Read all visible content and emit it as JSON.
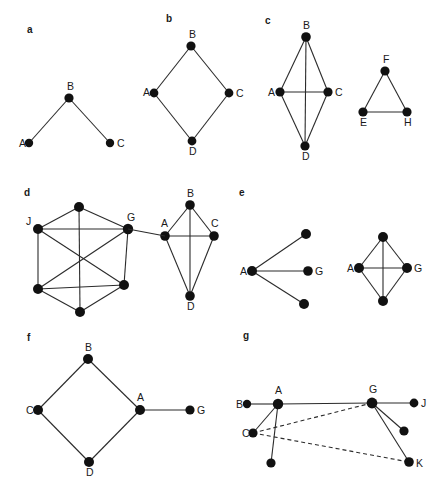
{
  "figure": {
    "width": 436,
    "height": 498,
    "background": "#ffffff",
    "edge_color": "#2b2b2b",
    "node_color": "#111111",
    "label_color": "#1a1a1a"
  },
  "panels": [
    {
      "id": "a",
      "letter": "a",
      "letter_pos": [
        27,
        33
      ],
      "graphs": [
        {
          "name": "path-graph",
          "nodes": [
            {
              "id": "A",
              "label": "A",
              "x": 29,
              "y": 143,
              "r": 4.2,
              "label_dx": -10,
              "label_dy": 4
            },
            {
              "id": "B",
              "label": "B",
              "x": 69,
              "y": 98,
              "r": 4.6,
              "label_dx": -2,
              "label_dy": -8
            },
            {
              "id": "C",
              "label": "C",
              "x": 110,
              "y": 143,
              "r": 4.2,
              "label_dx": 7,
              "label_dy": 4
            }
          ],
          "edges": [
            {
              "from": "A",
              "to": "B",
              "style": "solid"
            },
            {
              "from": "B",
              "to": "C",
              "style": "solid"
            }
          ]
        }
      ]
    },
    {
      "id": "b",
      "letter": "b",
      "letter_pos": [
        166,
        22
      ],
      "graphs": [
        {
          "name": "cycle-graph",
          "nodes": [
            {
              "id": "B",
              "label": "B",
              "x": 191,
              "y": 46,
              "r": 4.6,
              "label_dx": -2,
              "label_dy": -8
            },
            {
              "id": "A",
              "label": "A",
              "x": 154,
              "y": 93,
              "r": 4.4,
              "label_dx": -11,
              "label_dy": 3
            },
            {
              "id": "C",
              "label": "C",
              "x": 229,
              "y": 93,
              "r": 4.4,
              "label_dx": 7,
              "label_dy": 4
            },
            {
              "id": "D",
              "label": "D",
              "x": 192,
              "y": 141,
              "r": 4.4,
              "label_dx": -3,
              "label_dy": 14
            }
          ],
          "edges": [
            {
              "from": "A",
              "to": "B",
              "style": "solid"
            },
            {
              "from": "B",
              "to": "C",
              "style": "solid"
            },
            {
              "from": "C",
              "to": "D",
              "style": "solid"
            },
            {
              "from": "D",
              "to": "A",
              "style": "solid"
            }
          ]
        }
      ]
    },
    {
      "id": "c",
      "letter": "c",
      "letter_pos": [
        265,
        24
      ],
      "graphs": [
        {
          "name": "k4-graph",
          "nodes": [
            {
              "id": "B",
              "label": "B",
              "x": 306,
              "y": 37,
              "r": 4.8,
              "label_dx": -3,
              "label_dy": -8
            },
            {
              "id": "A",
              "label": "A",
              "x": 280,
              "y": 92,
              "r": 4.6,
              "label_dx": -12,
              "label_dy": 4
            },
            {
              "id": "C",
              "label": "C",
              "x": 328,
              "y": 92,
              "r": 4.6,
              "label_dx": 7,
              "label_dy": 4
            },
            {
              "id": "D",
              "label": "D",
              "x": 305,
              "y": 146,
              "r": 4.6,
              "label_dx": -3,
              "label_dy": 14
            }
          ],
          "edges": [
            {
              "from": "A",
              "to": "B",
              "style": "solid"
            },
            {
              "from": "B",
              "to": "C",
              "style": "solid"
            },
            {
              "from": "A",
              "to": "C",
              "style": "solid"
            },
            {
              "from": "A",
              "to": "D",
              "style": "solid"
            },
            {
              "from": "C",
              "to": "D",
              "style": "solid"
            },
            {
              "from": "B",
              "to": "D",
              "style": "solid"
            }
          ]
        },
        {
          "name": "triangle-graph",
          "nodes": [
            {
              "id": "F",
              "label": "F",
              "x": 385,
              "y": 71,
              "r": 4.6,
              "label_dx": -2,
              "label_dy": -8
            },
            {
              "id": "E",
              "label": "E",
              "x": 363,
              "y": 112,
              "r": 4.6,
              "label_dx": -3,
              "label_dy": 14
            },
            {
              "id": "H",
              "label": "H",
              "x": 407,
              "y": 112,
              "r": 4.6,
              "label_dx": -3,
              "label_dy": 14
            }
          ],
          "edges": [
            {
              "from": "E",
              "to": "F",
              "style": "solid"
            },
            {
              "from": "F",
              "to": "H",
              "style": "solid"
            },
            {
              "from": "E",
              "to": "H",
              "style": "solid"
            }
          ]
        }
      ]
    },
    {
      "id": "d",
      "letter": "d",
      "letter_pos": [
        24,
        196
      ],
      "graphs": [
        {
          "name": "hexagon-dense-graph",
          "nodes": [
            {
              "id": "T",
              "label": "",
              "x": 79,
              "y": 207,
              "r": 5.0,
              "label_dx": 0,
              "label_dy": 0
            },
            {
              "id": "J",
              "label": "J",
              "x": 38,
              "y": 229,
              "r": 5.0,
              "label_dx": -12,
              "label_dy": -4
            },
            {
              "id": "G",
              "label": "G",
              "x": 128,
              "y": 229,
              "r": 5.2,
              "label_dx": -1,
              "label_dy": -8
            },
            {
              "id": "LL",
              "label": "",
              "x": 38,
              "y": 289,
              "r": 5.0,
              "label_dx": 0,
              "label_dy": 0
            },
            {
              "id": "LR",
              "label": "",
              "x": 124,
              "y": 285,
              "r": 5.0,
              "label_dx": 0,
              "label_dy": 0
            },
            {
              "id": "BT",
              "label": "",
              "x": 80,
              "y": 312,
              "r": 5.0,
              "label_dx": 0,
              "label_dy": 0
            }
          ],
          "edges": [
            {
              "from": "T",
              "to": "J",
              "style": "solid"
            },
            {
              "from": "T",
              "to": "G",
              "style": "solid"
            },
            {
              "from": "J",
              "to": "G",
              "style": "solid"
            },
            {
              "from": "J",
              "to": "LL",
              "style": "solid"
            },
            {
              "from": "G",
              "to": "LR",
              "style": "solid"
            },
            {
              "from": "LL",
              "to": "BT",
              "style": "solid"
            },
            {
              "from": "LR",
              "to": "BT",
              "style": "solid"
            },
            {
              "from": "LL",
              "to": "LR",
              "style": "solid"
            },
            {
              "from": "J",
              "to": "LR",
              "style": "solid"
            },
            {
              "from": "G",
              "to": "LL",
              "style": "solid"
            },
            {
              "from": "T",
              "to": "BT",
              "style": "solid"
            }
          ]
        },
        {
          "name": "k4-graph",
          "nodes": [
            {
              "id": "B",
              "label": "B",
              "x": 190,
              "y": 205,
              "r": 4.8,
              "label_dx": -3,
              "label_dy": -8
            },
            {
              "id": "A",
              "label": "A",
              "x": 165,
              "y": 236,
              "r": 4.8,
              "label_dx": -4,
              "label_dy": -9
            },
            {
              "id": "C",
              "label": "C",
              "x": 214,
              "y": 236,
              "r": 4.8,
              "label_dx": -3,
              "label_dy": -9
            },
            {
              "id": "D",
              "label": "D",
              "x": 190,
              "y": 296,
              "r": 4.8,
              "label_dx": -3,
              "label_dy": 14
            }
          ],
          "edges": [
            {
              "from": "A",
              "to": "B",
              "style": "solid"
            },
            {
              "from": "B",
              "to": "C",
              "style": "solid"
            },
            {
              "from": "A",
              "to": "C",
              "style": "solid"
            },
            {
              "from": "A",
              "to": "D",
              "style": "solid"
            },
            {
              "from": "C",
              "to": "D",
              "style": "solid"
            },
            {
              "from": "B",
              "to": "D",
              "style": "solid"
            }
          ]
        },
        {
          "name": "bridge-edge",
          "nodes": [],
          "edges": [
            {
              "from_xy": [
                128,
                229
              ],
              "to_xy": [
                165,
                236
              ],
              "style": "solid"
            }
          ]
        }
      ]
    },
    {
      "id": "e",
      "letter": "e",
      "letter_pos": [
        239,
        196
      ],
      "graphs": [
        {
          "name": "star-graph",
          "nodes": [
            {
              "id": "A",
              "label": "A",
              "x": 252,
              "y": 271,
              "r": 5.0,
              "label_dx": -12,
              "label_dy": 4
            },
            {
              "id": "N1",
              "label": "",
              "x": 306,
              "y": 234,
              "r": 5.0,
              "label_dx": 0,
              "label_dy": 0
            },
            {
              "id": "G",
              "label": "G",
              "x": 308,
              "y": 271,
              "r": 4.8,
              "label_dx": 7,
              "label_dy": 4
            },
            {
              "id": "N2",
              "label": "",
              "x": 304,
              "y": 304,
              "r": 5.0,
              "label_dx": 0,
              "label_dy": 0
            }
          ],
          "edges": [
            {
              "from": "A",
              "to": "N1",
              "style": "solid"
            },
            {
              "from": "A",
              "to": "G",
              "style": "solid"
            },
            {
              "from": "A",
              "to": "N2",
              "style": "solid"
            }
          ]
        },
        {
          "name": "k4-graph",
          "nodes": [
            {
              "id": "TOP",
              "label": "",
              "x": 383,
              "y": 237,
              "r": 5.0,
              "label_dx": 0,
              "label_dy": 0
            },
            {
              "id": "A",
              "label": "A",
              "x": 359,
              "y": 268,
              "r": 5.0,
              "label_dx": -12,
              "label_dy": 4
            },
            {
              "id": "G",
              "label": "G",
              "x": 407,
              "y": 268,
              "r": 5.0,
              "label_dx": 7,
              "label_dy": 4
            },
            {
              "id": "BOT",
              "label": "",
              "x": 383,
              "y": 301,
              "r": 5.0,
              "label_dx": 0,
              "label_dy": 0
            }
          ],
          "edges": [
            {
              "from": "A",
              "to": "TOP",
              "style": "solid"
            },
            {
              "from": "TOP",
              "to": "G",
              "style": "solid"
            },
            {
              "from": "A",
              "to": "G",
              "style": "solid"
            },
            {
              "from": "A",
              "to": "BOT",
              "style": "solid"
            },
            {
              "from": "G",
              "to": "BOT",
              "style": "solid"
            },
            {
              "from": "TOP",
              "to": "BOT",
              "style": "solid"
            }
          ]
        }
      ]
    },
    {
      "id": "f",
      "letter": "f",
      "letter_pos": [
        27,
        341
      ],
      "graphs": [
        {
          "name": "diamond-with-tail-graph",
          "nodes": [
            {
              "id": "B",
              "label": "B",
              "x": 88,
              "y": 359,
              "r": 5.0,
              "label_dx": -3,
              "label_dy": -8
            },
            {
              "id": "C",
              "label": "C",
              "x": 38,
              "y": 410,
              "r": 5.0,
              "label_dx": -12,
              "label_dy": 4
            },
            {
              "id": "A",
              "label": "A",
              "x": 140,
              "y": 410,
              "r": 5.0,
              "label_dx": -3,
              "label_dy": -9
            },
            {
              "id": "D",
              "label": "D",
              "x": 89,
              "y": 462,
              "r": 5.0,
              "label_dx": -3,
              "label_dy": 14
            },
            {
              "id": "G",
              "label": "G",
              "x": 190,
              "y": 410,
              "r": 4.6,
              "label_dx": 7,
              "label_dy": 4
            }
          ],
          "edges": [
            {
              "from": "B",
              "to": "C",
              "style": "solid"
            },
            {
              "from": "B",
              "to": "A",
              "style": "solid"
            },
            {
              "from": "C",
              "to": "D",
              "style": "solid"
            },
            {
              "from": "D",
              "to": "A",
              "style": "solid"
            },
            {
              "from": "A",
              "to": "G",
              "style": "solid"
            }
          ]
        }
      ]
    },
    {
      "id": "g",
      "letter": "g",
      "letter_pos": [
        243,
        339
      ],
      "graphs": [
        {
          "name": "mixed-solid-dashed-graph",
          "nodes": [
            {
              "id": "B",
              "label": "B",
              "x": 247,
              "y": 404,
              "r": 4.2,
              "label_dx": -11,
              "label_dy": 4
            },
            {
              "id": "A",
              "label": "A",
              "x": 278,
              "y": 404,
              "r": 5.2,
              "label_dx": -3,
              "label_dy": -10
            },
            {
              "id": "G",
              "label": "G",
              "x": 372,
              "y": 403,
              "r": 5.4,
              "label_dx": -3,
              "label_dy": -10
            },
            {
              "id": "J",
              "label": "J",
              "x": 414,
              "y": 403,
              "r": 4.4,
              "label_dx": 7,
              "label_dy": 4
            },
            {
              "id": "C",
              "label": "C",
              "x": 253,
              "y": 433,
              "r": 4.6,
              "label_dx": -11,
              "label_dy": 4
            },
            {
              "id": "N1",
              "label": "",
              "x": 271,
              "y": 463,
              "r": 4.6,
              "label_dx": 0,
              "label_dy": 0
            },
            {
              "id": "N2",
              "label": "",
              "x": 404,
              "y": 431,
              "r": 4.6,
              "label_dx": 0,
              "label_dy": 0
            },
            {
              "id": "K",
              "label": "K",
              "x": 409,
              "y": 462,
              "r": 4.8,
              "label_dx": 7,
              "label_dy": 5
            }
          ],
          "edges": [
            {
              "from": "B",
              "to": "A",
              "style": "solid"
            },
            {
              "from": "A",
              "to": "G",
              "style": "solid"
            },
            {
              "from": "G",
              "to": "J",
              "style": "solid"
            },
            {
              "from": "A",
              "to": "C",
              "style": "solid"
            },
            {
              "from": "A",
              "to": "N1",
              "style": "solid"
            },
            {
              "from": "G",
              "to": "N2",
              "style": "solid"
            },
            {
              "from": "G",
              "to": "K",
              "style": "solid"
            },
            {
              "from": "C",
              "to": "G",
              "style": "dashed"
            },
            {
              "from": "C",
              "to": "K",
              "style": "dashed"
            }
          ]
        }
      ]
    }
  ]
}
